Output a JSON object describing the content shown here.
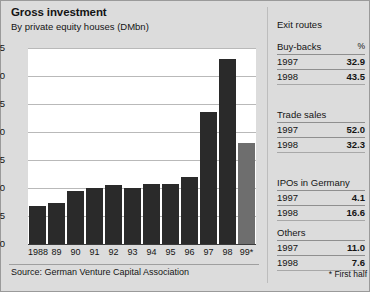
{
  "header": {
    "title": "Gross investment",
    "subtitle": "By private equity houses (DMbn)"
  },
  "chart_data": {
    "type": "bar",
    "title": "Gross investment",
    "subtitle": "By private equity houses (DMbn)",
    "xlabel": "",
    "ylabel": "DMbn",
    "ylim": [
      0,
      3.5
    ],
    "yticks": [
      "0",
      "0.5",
      "1.0",
      "1.5",
      "2.0",
      "2.5",
      "3.0",
      "3.5"
    ],
    "ytick_values": [
      0,
      0.5,
      1.0,
      1.5,
      2.0,
      2.5,
      3.0,
      3.5
    ],
    "grid": true,
    "legend": "none",
    "categories": [
      "1988",
      "89",
      "90",
      "91",
      "92",
      "93",
      "94",
      "95",
      "96",
      "97",
      "98",
      "99*"
    ],
    "values": [
      0.67,
      0.73,
      0.95,
      1.0,
      1.06,
      1.0,
      1.07,
      1.07,
      1.2,
      2.35,
      3.3,
      1.8
    ],
    "colors": [
      "#2a2a2a",
      "#2a2a2a",
      "#2a2a2a",
      "#2a2a2a",
      "#2a2a2a",
      "#2a2a2a",
      "#2a2a2a",
      "#2a2a2a",
      "#2a2a2a",
      "#2a2a2a",
      "#2a2a2a",
      "#6e6e6e"
    ],
    "annotations": [
      "* First half"
    ]
  },
  "palette": {
    "background": "#dcdcdc",
    "plot_background": "#ffffff",
    "bar_dark": "#2a2a2a",
    "bar_gray": "#6e6e6e",
    "gridline": "#b9b9b9",
    "rule": "#8f8f8f"
  },
  "source": {
    "text": "Source: German Venture Capital Association"
  },
  "panel": {
    "title": "Exit routes",
    "percent_label": "%",
    "groups": [
      {
        "name": "Buy-backs",
        "rows": [
          {
            "year": "1997",
            "value": "32.9"
          },
          {
            "year": "1998",
            "value": "43.5"
          }
        ]
      },
      {
        "name": "Trade sales",
        "rows": [
          {
            "year": "1997",
            "value": "52.0"
          },
          {
            "year": "1998",
            "value": "32.3"
          }
        ]
      },
      {
        "name": "IPOs in Germany",
        "rows": [
          {
            "year": "1997",
            "value": "4.1"
          },
          {
            "year": "1998",
            "value": "16.6"
          }
        ]
      },
      {
        "name": "Others",
        "rows": [
          {
            "year": "1997",
            "value": "11.0"
          },
          {
            "year": "1998",
            "value": "7.6"
          }
        ]
      }
    ],
    "footnote": "* First half"
  }
}
